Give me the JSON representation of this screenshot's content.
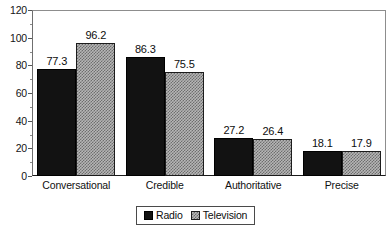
{
  "chart_data": {
    "type": "bar",
    "title": "",
    "subtitle": "",
    "xlabel": "",
    "ylabel": "",
    "categories": [
      "Conversational",
      "Credible",
      "Authoritative",
      "Precise"
    ],
    "series": [
      {
        "name": "Radio",
        "values": [
          77.3,
          86.3,
          27.2,
          18.1
        ],
        "color": "#121212",
        "fill": "solid"
      },
      {
        "name": "Television",
        "values": [
          96.2,
          75.5,
          26.4,
          17.9
        ],
        "color": "#b6b6b6",
        "fill": "fine-dot-texture"
      }
    ],
    "ylim": [
      0,
      120
    ],
    "y_major_ticks": [
      0,
      20,
      40,
      60,
      80,
      100,
      120
    ],
    "y_minor_ticks": [
      10,
      30,
      50,
      70,
      90,
      110
    ],
    "y_tick_labels": [
      "0",
      "20",
      "40",
      "60",
      "80",
      "100",
      "120"
    ],
    "grid": false,
    "legend_position": "bottom-center",
    "legend_entries": [
      "Radio",
      "Television"
    ],
    "data_labels": [
      [
        "77.3",
        "96.2"
      ],
      [
        "86.3",
        "75.5"
      ],
      [
        "27.2",
        "26.4"
      ],
      [
        "18.1",
        "17.9"
      ]
    ]
  }
}
